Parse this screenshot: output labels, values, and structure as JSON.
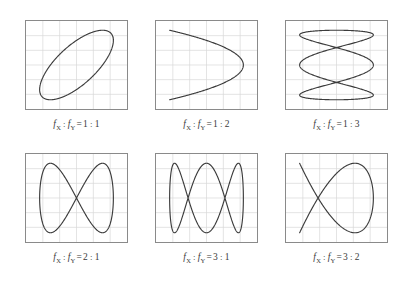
{
  "figure": {
    "columns": 3,
    "rows": 2,
    "background_color": "#ffffff",
    "frame_color": "#8a8a8a",
    "grid_color": "#d9d9d9",
    "curve_color": "#3c3c3c",
    "grid_divisions": 6,
    "label_color": "#3a3a3a"
  },
  "notation": {
    "fx_symbol": "f",
    "fx_subscript": "X",
    "fy_symbol": "f",
    "fy_subscript": "Y",
    "ratio_separator": ":",
    "equals": "="
  },
  "panels": [
    {
      "id": "panel-1-1",
      "fx": 1,
      "fy": 1,
      "ratio_left": "1",
      "ratio_right": "1",
      "caption": "f X : f Y = 1 : 1",
      "shape_description": "tilted ellipse",
      "phase_deg": 45,
      "lobes_x": 1,
      "lobes_y": 1
    },
    {
      "id": "panel-1-2",
      "fx": 1,
      "fy": 2,
      "ratio_left": "1",
      "ratio_right": "2",
      "caption": "f X : f Y = 1 : 2",
      "shape_description": "horizontal figure-eight",
      "phase_deg": 90,
      "lobes_x": 2,
      "lobes_y": 1
    },
    {
      "id": "panel-1-3",
      "fx": 1,
      "fy": 3,
      "ratio_left": "1",
      "ratio_right": "3",
      "caption": "f X : f Y = 1 : 3",
      "shape_description": "three vertical lobes in a row",
      "phase_deg": 90,
      "lobes_x": 3,
      "lobes_y": 1
    },
    {
      "id": "panel-2-1",
      "fx": 2,
      "fy": 1,
      "ratio_left": "2",
      "ratio_right": "1",
      "caption": "f X : f Y = 2 : 1",
      "shape_description": "vertical figure-eight",
      "phase_deg": 90,
      "lobes_x": 1,
      "lobes_y": 2
    },
    {
      "id": "panel-2-2",
      "fx": 3,
      "fy": 1,
      "ratio_left": "3",
      "ratio_right": "1",
      "caption": "f X : f Y = 3 : 1",
      "shape_description": "three horizontal lobes stacked",
      "phase_deg": 90,
      "lobes_x": 1,
      "lobes_y": 3
    },
    {
      "id": "panel-2-3",
      "fx": 3,
      "fy": 2,
      "ratio_left": "3",
      "ratio_right": "2",
      "caption": "f X : f Y = 3 : 2",
      "shape_description": "interlaced 3:2 Lissajous knot",
      "phase_deg": 90,
      "lobes_x": 2,
      "lobes_y": 3
    }
  ],
  "chart_data": {
    "type": "line",
    "xlabel": "",
    "ylabel": "",
    "xlim": [
      -1,
      1
    ],
    "ylim": [
      -1,
      1
    ],
    "grid": true,
    "legend_position": "none",
    "series": [
      {
        "name": "f_X : f_Y = 1 : 1",
        "fx": 1,
        "fy": 1,
        "phase_deg": 45,
        "parametric": "x = sin(1*t + 45deg), y = sin(1*t)"
      },
      {
        "name": "f_X : f_Y = 1 : 2",
        "fx": 1,
        "fy": 2,
        "phase_deg": 90,
        "parametric": "x = sin(2*t + 90deg), y = sin(1*t)"
      },
      {
        "name": "f_X : f_Y = 1 : 3",
        "fx": 1,
        "fy": 3,
        "phase_deg": 90,
        "parametric": "x = sin(3*t + 90deg), y = sin(1*t)"
      },
      {
        "name": "f_X : f_Y = 2 : 1",
        "fx": 2,
        "fy": 1,
        "phase_deg": 90,
        "parametric": "x = sin(1*t + 90deg), y = sin(2*t)"
      },
      {
        "name": "f_X : f_Y = 3 : 1",
        "fx": 3,
        "fy": 1,
        "phase_deg": 90,
        "parametric": "x = sin(1*t + 90deg), y = sin(3*t)"
      },
      {
        "name": "f_X : f_Y = 3 : 2",
        "fx": 3,
        "fy": 2,
        "phase_deg": 90,
        "parametric": "x = sin(2*t + 90deg), y = sin(3*t)"
      }
    ]
  },
  "layout": {
    "panel_width": 103,
    "panel_height": 90,
    "col_x": [
      25,
      155,
      285
    ],
    "row_y": [
      20,
      153
    ]
  }
}
